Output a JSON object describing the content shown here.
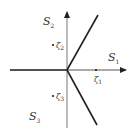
{
  "diagram": {
    "regions": [
      {
        "name": "S",
        "sub": "1"
      },
      {
        "name": "S",
        "sub": "2"
      },
      {
        "name": "S",
        "sub": "3"
      }
    ],
    "points": [
      {
        "name": "ζ",
        "sub": "1"
      },
      {
        "name": "ζ",
        "sub": "2"
      },
      {
        "name": "ζ",
        "sub": "3"
      }
    ],
    "colors": {
      "axis": "#555555",
      "ray": "#222222",
      "text": "#333333"
    }
  }
}
